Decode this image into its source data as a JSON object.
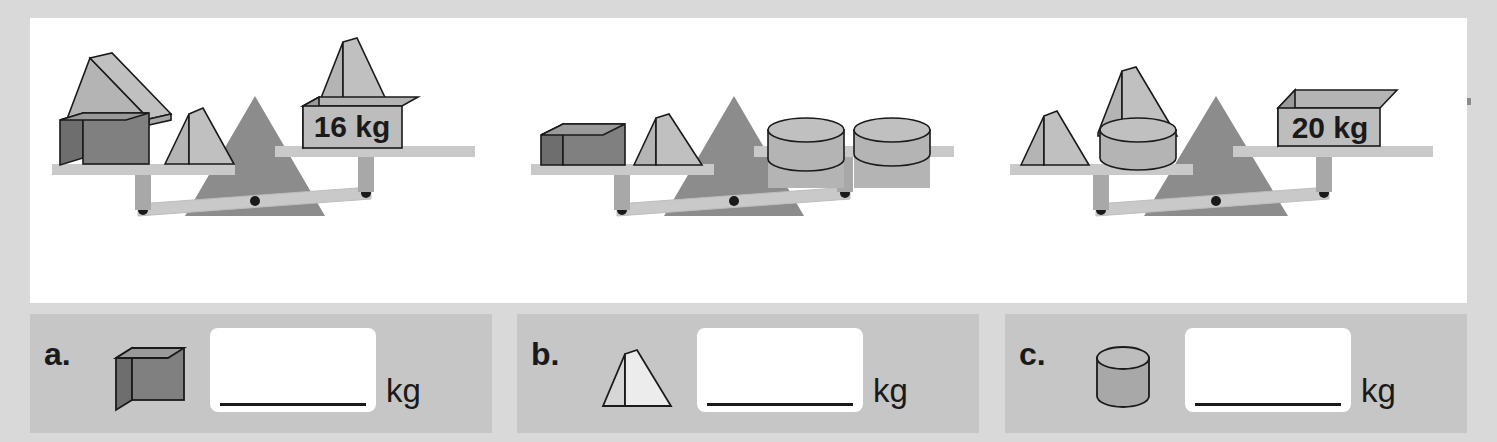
{
  "page": {
    "background_color": "#d9d9d9",
    "panel_color": "#ffffff",
    "answer_panel_color": "#c6c6c6"
  },
  "colors": {
    "shape_light": "#b4b4b4",
    "shape_light_face": "#c0c0c0",
    "shape_mid": "#a6a6a6",
    "shape_dark": "#808080",
    "shape_dark_face": "#6e6e6e",
    "pan_color": "#c9c9c9",
    "beam_color": "#c9c9c9",
    "fulcrum_color": "#8c8c8c",
    "outline": "#1a1a1a",
    "text": "#1a1a1a"
  },
  "scales": [
    {
      "id": "scale-1",
      "tilt": "left-down",
      "left_pan": {
        "items": [
          {
            "shape": "cube",
            "tone": "dark",
            "stacked_with": "triangular-prism"
          },
          {
            "shape": "triangular-prism",
            "tone": "light"
          }
        ]
      },
      "right_pan": {
        "items": [
          {
            "shape": "triangular-prism",
            "tone": "light"
          },
          {
            "shape": "weight-box",
            "label": "16 kg"
          }
        ]
      },
      "weight_label": "16 kg"
    },
    {
      "id": "scale-2",
      "tilt": "left-down",
      "left_pan": {
        "items": [
          {
            "shape": "cube",
            "tone": "dark"
          },
          {
            "shape": "triangular-prism",
            "tone": "light"
          }
        ]
      },
      "right_pan": {
        "items": [
          {
            "shape": "cylinder",
            "tone": "light"
          },
          {
            "shape": "cylinder",
            "tone": "light"
          }
        ]
      },
      "weight_label": ""
    },
    {
      "id": "scale-3",
      "tilt": "left-down",
      "left_pan": {
        "items": [
          {
            "shape": "triangular-prism",
            "tone": "light"
          },
          {
            "shape": "cylinder",
            "tone": "light",
            "stacked_with": "triangular-prism"
          }
        ]
      },
      "right_pan": {
        "items": [
          {
            "shape": "weight-box",
            "label": "20 kg"
          }
        ]
      },
      "weight_label": "20 kg"
    }
  ],
  "answers": [
    {
      "id": "answer-a",
      "label": "a.",
      "shape": "cube",
      "shape_tone": "dark",
      "value": "",
      "placeholder": "",
      "unit": "kg"
    },
    {
      "id": "answer-b",
      "label": "b.",
      "shape": "triangular-prism",
      "shape_tone": "outline",
      "value": "",
      "placeholder": "",
      "unit": "kg"
    },
    {
      "id": "answer-c",
      "label": "c.",
      "shape": "cylinder",
      "shape_tone": "light",
      "value": "",
      "placeholder": "",
      "unit": "kg"
    }
  ]
}
